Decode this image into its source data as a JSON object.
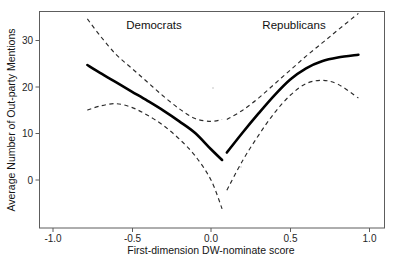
{
  "chart_data": {
    "type": "line",
    "title": "",
    "xlabel": "First-dimension DW-nominate score",
    "ylabel": "Average Number of Out-party Mentions",
    "xlim": [
      -1.15,
      1.1
    ],
    "ylim": [
      -9,
      36
    ],
    "grid": false,
    "legend_position": "none",
    "xticks": [
      -1.0,
      -0.5,
      0.0,
      0.5,
      1.0
    ],
    "xtick_labels": [
      "-1.0",
      "-0.5",
      "0.0",
      "0.5",
      "1.0"
    ],
    "yticks": [
      0,
      10,
      20,
      30
    ],
    "ytick_labels": [
      "0",
      "10",
      "20",
      "30"
    ],
    "annotations": [
      {
        "text": "Democrats",
        "x": -0.36,
        "y": 34.5
      },
      {
        "text": "Republicans",
        "x": 0.52,
        "y": 34.5
      }
    ],
    "series": [
      {
        "name": "Democrats fit",
        "style": "solid",
        "color": "#000000",
        "x": [
          -0.78,
          -0.7,
          -0.6,
          -0.5,
          -0.4,
          -0.3,
          -0.2,
          -0.1,
          0.0,
          0.07
        ],
        "y": [
          24.7,
          23.0,
          21.0,
          19.0,
          17.0,
          14.9,
          12.6,
          10.1,
          6.6,
          4.3
        ]
      },
      {
        "name": "Democrats upper 95% CI",
        "style": "dashed",
        "color": "#2b2b2b",
        "x": [
          -0.78,
          -0.7,
          -0.6,
          -0.5,
          -0.4,
          -0.3,
          -0.2,
          -0.1,
          0.0,
          0.07
        ],
        "y": [
          34.6,
          31.0,
          27.0,
          24.0,
          21.0,
          18.0,
          15.3,
          13.2,
          12.6,
          13.0
        ]
      },
      {
        "name": "Democrats lower 95% CI",
        "style": "dashed",
        "color": "#2b2b2b",
        "x": [
          -0.78,
          -0.7,
          -0.6,
          -0.5,
          -0.4,
          -0.3,
          -0.2,
          -0.1,
          0.0,
          0.07
        ],
        "y": [
          15.0,
          15.9,
          16.4,
          15.6,
          13.9,
          11.7,
          8.8,
          5.2,
          0.0,
          -6.2
        ]
      },
      {
        "name": "Republicans fit",
        "style": "solid",
        "color": "#000000",
        "x": [
          0.1,
          0.2,
          0.3,
          0.4,
          0.5,
          0.6,
          0.7,
          0.8,
          0.93
        ],
        "y": [
          5.9,
          10.2,
          14.3,
          18.2,
          21.6,
          24.0,
          25.5,
          26.3,
          26.9
        ]
      },
      {
        "name": "Republicans upper 95% CI",
        "style": "dashed",
        "color": "#2b2b2b",
        "x": [
          0.1,
          0.2,
          0.3,
          0.4,
          0.5,
          0.6,
          0.7,
          0.8,
          0.93
        ],
        "y": [
          13.0,
          15.0,
          17.6,
          20.6,
          23.6,
          26.6,
          29.4,
          32.2,
          35.8
        ]
      },
      {
        "name": "Republicans lower 95% CI",
        "style": "dashed",
        "color": "#2b2b2b",
        "x": [
          0.1,
          0.2,
          0.3,
          0.4,
          0.5,
          0.6,
          0.7,
          0.8,
          0.93
        ],
        "y": [
          -2.2,
          4.2,
          9.6,
          14.4,
          18.2,
          20.7,
          21.4,
          20.6,
          17.6
        ]
      }
    ]
  },
  "axes": {
    "x_title": "First-dimension DW-nominate score",
    "y_title": "Average Number of Out-party Mentions",
    "x_ticks": [
      "-1.0",
      "-0.5",
      "0.0",
      "0.5",
      "1.0"
    ],
    "y_ticks": [
      "30",
      "20",
      "10",
      "0"
    ]
  },
  "labels": {
    "democrats": "Democrats",
    "republicans": "Republicans"
  },
  "caption": {
    "partial_text": ""
  }
}
